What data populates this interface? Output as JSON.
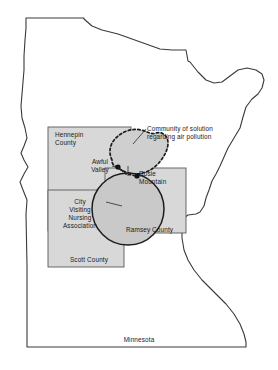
{
  "figure": {
    "state_name": "Minnesota",
    "caption_labels": {
      "state": "Minnesota"
    }
  },
  "counties": [
    {
      "id": "hennepin",
      "label": "Hennepin\nCounty"
    },
    {
      "id": "ramsey",
      "label": "Ramsey County"
    },
    {
      "id": "scott",
      "label": "Scott County"
    }
  ],
  "places": [
    {
      "id": "awful-valley",
      "label": "Awful\nValley"
    },
    {
      "id": "rosie-mountain",
      "label": "Rosie\nMountain"
    }
  ],
  "annotations": [
    {
      "id": "community-of-solution",
      "label": "Community of solution\nregarding air pollution"
    },
    {
      "id": "nursing-association",
      "label": "City\nVisiting\nNursing\nAssociation"
    }
  ],
  "colors": {
    "county_fill": "#d8d8d8",
    "county_stroke": "#5a5a5a",
    "state_stroke": "#3a3a3a",
    "blob_fill": "#cfcfcf",
    "blob_stroke": "#1c1c1c",
    "circle_fill": "#c9c9c9",
    "circle_stroke": "#1c1c1c",
    "dot_fill": "#111111",
    "background": "#ffffff",
    "text": "#1a1a1a"
  }
}
